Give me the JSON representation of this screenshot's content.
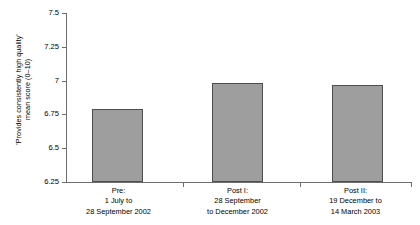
{
  "chart_data": {
    "type": "bar",
    "title": "",
    "xlabel": "",
    "ylabel_lines": [
      "'Provides consistently high quality'",
      "mean score (0–10)"
    ],
    "categories": [
      "Pre:\n1 July to\n28 September 2002",
      "Post I:\n28 September\nto December 2002",
      "Post II:\n19 December to\n14 March 2003"
    ],
    "category_lines": [
      [
        "Pre:",
        "1 July to",
        "28 September 2002"
      ],
      [
        "Post I:",
        "28 September",
        "to December 2002"
      ],
      [
        "Post II:",
        "19 December to",
        "14 March 2003"
      ]
    ],
    "values": [
      6.79,
      6.98,
      6.97
    ],
    "ylim": [
      6.25,
      7.5
    ],
    "ytick_labels": [
      "7.5",
      "7.25",
      "7",
      "6.75",
      "6.5",
      "6.25"
    ],
    "ytick_values": [
      7.5,
      7.25,
      7,
      6.75,
      6.5,
      6.25
    ],
    "grid": false,
    "legend": "none",
    "bar_fill_color": "#9e9e9e",
    "bar_border_color": "#4d4d4d",
    "axis_color": "#6d6d6d",
    "background_color": "#ffffff"
  }
}
